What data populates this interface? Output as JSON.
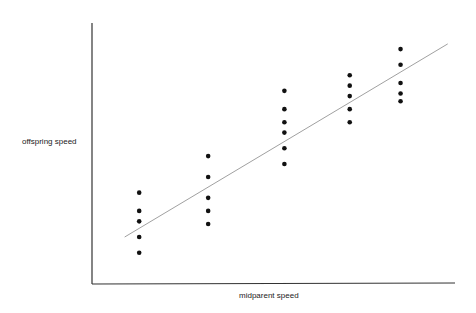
{
  "chart_data": {
    "type": "scatter",
    "title": "",
    "xlabel": "midparent speed",
    "ylabel": "offspring speed",
    "x_ticks": [],
    "y_ticks": [],
    "grid": false,
    "legend": null,
    "units_note": "No numeric ticks shown; values in relative units 0-100 along each axis",
    "xlim": [
      0,
      100
    ],
    "ylim": [
      0,
      100
    ],
    "series": [
      {
        "name": "offspring",
        "marker": "dot",
        "points": [
          {
            "x": 13,
            "y": 35
          },
          {
            "x": 13,
            "y": 28
          },
          {
            "x": 13,
            "y": 24
          },
          {
            "x": 13,
            "y": 18
          },
          {
            "x": 13,
            "y": 12
          },
          {
            "x": 32,
            "y": 49
          },
          {
            "x": 32,
            "y": 41
          },
          {
            "x": 32,
            "y": 33
          },
          {
            "x": 32,
            "y": 28
          },
          {
            "x": 32,
            "y": 23
          },
          {
            "x": 53,
            "y": 74
          },
          {
            "x": 53,
            "y": 67
          },
          {
            "x": 53,
            "y": 62
          },
          {
            "x": 53,
            "y": 58
          },
          {
            "x": 53,
            "y": 52
          },
          {
            "x": 53,
            "y": 46
          },
          {
            "x": 71,
            "y": 80
          },
          {
            "x": 71,
            "y": 76
          },
          {
            "x": 71,
            "y": 72
          },
          {
            "x": 71,
            "y": 67
          },
          {
            "x": 71,
            "y": 62
          },
          {
            "x": 85,
            "y": 90
          },
          {
            "x": 85,
            "y": 84
          },
          {
            "x": 85,
            "y": 77
          },
          {
            "x": 85,
            "y": 73
          },
          {
            "x": 85,
            "y": 70
          }
        ]
      }
    ],
    "regression_line": {
      "x1": 9,
      "y1": 18,
      "x2": 98,
      "y2": 92
    }
  },
  "colors": {
    "axis": "#333333",
    "point": "#111111",
    "line": "#888888",
    "background": "#ffffff"
  },
  "labels": {
    "x_axis": "midparent speed",
    "y_axis": "offspring speed"
  }
}
